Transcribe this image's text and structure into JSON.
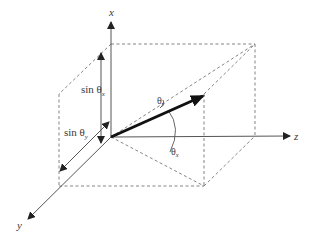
{
  "diagram": {
    "title": "",
    "axes": {
      "x": {
        "label": "x"
      },
      "y": {
        "label": "y"
      },
      "z": {
        "label": "z"
      }
    },
    "labels": {
      "sin_theta_x": {
        "prefix": "sin θ",
        "sub": "x"
      },
      "sin_theta_y": {
        "prefix": "sin θ",
        "sub": "y"
      },
      "theta_y": {
        "prefix": "θ",
        "sub": "y"
      },
      "theta_x": {
        "prefix": "θ",
        "sub": "x"
      }
    },
    "colors": {
      "line": "#555555",
      "dashed": "#777777",
      "vector": "#1a1a1a",
      "text": "#3a3a3a"
    }
  }
}
